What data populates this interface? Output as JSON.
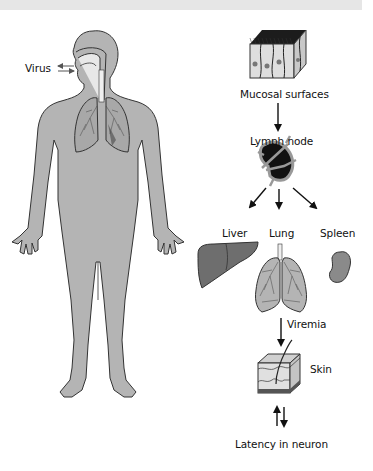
{
  "diagram": {
    "colors": {
      "body_fill": "#b4b4b4",
      "outline": "#333333",
      "organ_dark": "#6e6e6e",
      "lymph_node": "#151515",
      "band": "#e6e6e6"
    },
    "labels": {
      "virus": "Virus",
      "mucosal": "Mucosal surfaces",
      "lymph_node": "Lymph node",
      "liver": "Liver",
      "lung": "Lung",
      "spleen": "Spleen",
      "viremia": "Viremia",
      "skin": "Skin",
      "latency": "Latency in neuron"
    },
    "flow": [
      {
        "from": "Mucosal surfaces",
        "to": "Lymph node"
      },
      {
        "from": "Lymph node",
        "to": "Liver"
      },
      {
        "from": "Lymph node",
        "to": "Lung"
      },
      {
        "from": "Lymph node",
        "to": "Spleen"
      },
      {
        "from": "Lung",
        "to": "Skin",
        "label": "Viremia"
      },
      {
        "from": "Skin",
        "to": "Latency in neuron",
        "bidirectional": true
      }
    ]
  }
}
